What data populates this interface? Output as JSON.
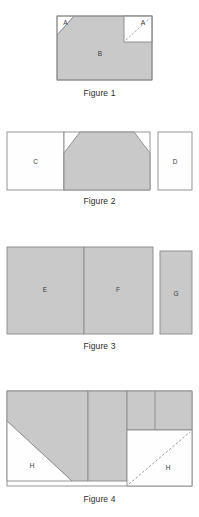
{
  "document": {
    "title": "Geometric dissection figures",
    "background_color": "#ffffff"
  },
  "style": {
    "shaded_fill": "#c9c9c9",
    "white_fill": "#fefefe",
    "stroke_color": "#8a8a8a",
    "label_color": "#3a3a3a",
    "caption_color": "#2b2b2b",
    "dash_color": "#9a9a9a"
  },
  "figures": [
    {
      "id": "figure-1",
      "caption": "Figure 1",
      "description": "Shaded rectangle with a white right triangle cut from the top-left corner and a white square with a dashed diagonal at the top-right corner.",
      "labels": {
        "triangle_piece": "A",
        "square_piece": "A",
        "main_region": "B"
      }
    },
    {
      "id": "figure-2",
      "caption": "Figure 2",
      "description": "White rectangle C at left, shaded trapezoid at centre, detached white rectangle D at right.",
      "labels": {
        "left_rect": "C",
        "right_rect": "D"
      }
    },
    {
      "id": "figure-3",
      "caption": "Figure 3",
      "description": "Two adjoining shaded rectangles E and F with a detached narrower shaded rectangle G at the right.",
      "labels": {
        "left_rect": "E",
        "middle_rect": "F",
        "right_rect": "G"
      }
    },
    {
      "id": "figure-4",
      "caption": "Figure 4",
      "description": "Shaded compound region with a white right triangle at the bottom-left and a white square with a dashed diagonal at the bottom-right.",
      "labels": {
        "triangle_piece": "H",
        "square_piece": "H"
      }
    }
  ]
}
